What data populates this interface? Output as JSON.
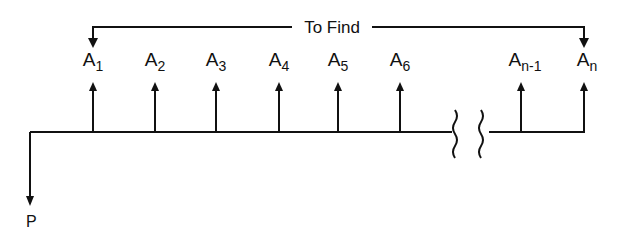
{
  "diagram": {
    "type": "cash-flow-diagram",
    "bracket_label": "To Find",
    "present_value_label": "P",
    "cash_flows": [
      {
        "base": "A",
        "sub": "1",
        "x": 93
      },
      {
        "base": "A",
        "sub": "2",
        "x": 155
      },
      {
        "base": "A",
        "sub": "3",
        "x": 216
      },
      {
        "base": "A",
        "sub": "4",
        "x": 279
      },
      {
        "base": "A",
        "sub": "5",
        "x": 338
      },
      {
        "base": "A",
        "sub": "6",
        "x": 400
      },
      {
        "base": "A",
        "sub": "n-1",
        "x": 521
      },
      {
        "base": "A",
        "sub": "n",
        "x": 584
      }
    ],
    "colors": {
      "ink": "#111111",
      "background": "#ffffff"
    }
  }
}
